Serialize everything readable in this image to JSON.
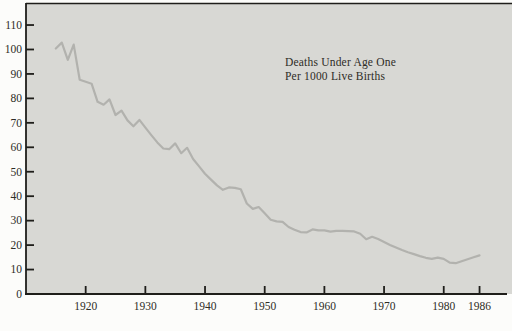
{
  "page": {
    "background": "#fcfcfa"
  },
  "chart_data": {
    "type": "line",
    "title": "Deaths Under Age One Per 1000 Live Births",
    "annotation_lines": [
      "Deaths Under Age One",
      "Per 1000 Live Births"
    ],
    "xlabel": "",
    "ylabel": "",
    "grid": false,
    "legend": "none",
    "xlim": [
      1910,
      1990.6
    ],
    "ylim": [
      0,
      118.6
    ],
    "x_ticks": [
      1920,
      1930,
      1940,
      1950,
      1960,
      1970,
      1980,
      1986
    ],
    "x_tick_labels": [
      "1920",
      "1930",
      "1940",
      "1950",
      "1960",
      "1970",
      "1980",
      "1986"
    ],
    "y_ticks": [
      0,
      10,
      20,
      30,
      40,
      50,
      60,
      70,
      80,
      90,
      100,
      110
    ],
    "y_tick_labels": [
      "0",
      "10",
      "20",
      "30",
      "40",
      "50",
      "60",
      "70",
      "80",
      "90",
      "100",
      "110"
    ],
    "x": [
      1915,
      1916,
      1917,
      1918,
      1919,
      1920,
      1921,
      1922,
      1923,
      1924,
      1925,
      1926,
      1927,
      1928,
      1929,
      1930,
      1931,
      1932,
      1933,
      1934,
      1935,
      1936,
      1937,
      1938,
      1939,
      1940,
      1941,
      1942,
      1943,
      1944,
      1945,
      1946,
      1947,
      1948,
      1949,
      1950,
      1951,
      1952,
      1953,
      1954,
      1955,
      1956,
      1957,
      1958,
      1959,
      1960,
      1961,
      1962,
      1963,
      1964,
      1965,
      1966,
      1967,
      1968,
      1969,
      1970,
      1971,
      1972,
      1973,
      1974,
      1975,
      1976,
      1977,
      1978,
      1979,
      1980,
      1981,
      1982,
      1983,
      1984,
      1985,
      1986
    ],
    "values": [
      100.4,
      102.8,
      95.8,
      102.0,
      87.6,
      86.8,
      86.0,
      78.6,
      77.4,
      79.6,
      73.2,
      75.0,
      71.0,
      68.6,
      71.2,
      68.0,
      65.0,
      62.0,
      59.5,
      59.2,
      61.6,
      57.6,
      59.8,
      55.2,
      52.2,
      49.2,
      46.8,
      44.4,
      42.6,
      43.6,
      43.4,
      42.8,
      37.0,
      34.8,
      35.6,
      33.0,
      30.4,
      29.7,
      29.5,
      27.4,
      26.3,
      25.3,
      25.2,
      26.4,
      26.0,
      26.0,
      25.5,
      25.8,
      25.8,
      25.7,
      25.6,
      24.6,
      22.4,
      23.4,
      22.5,
      21.3,
      20.1,
      19.0,
      18.0,
      17.1,
      16.3,
      15.5,
      14.8,
      14.4,
      14.9,
      14.4,
      12.8,
      12.6,
      13.4,
      14.2,
      15.0,
      15.8
    ],
    "colors": {
      "plot_bg": "#d8d8d4",
      "line": "#b2b2ae",
      "axis": "#1f1e1a",
      "text": "#2e2c26",
      "page_bg": "#fcfcfa"
    }
  }
}
